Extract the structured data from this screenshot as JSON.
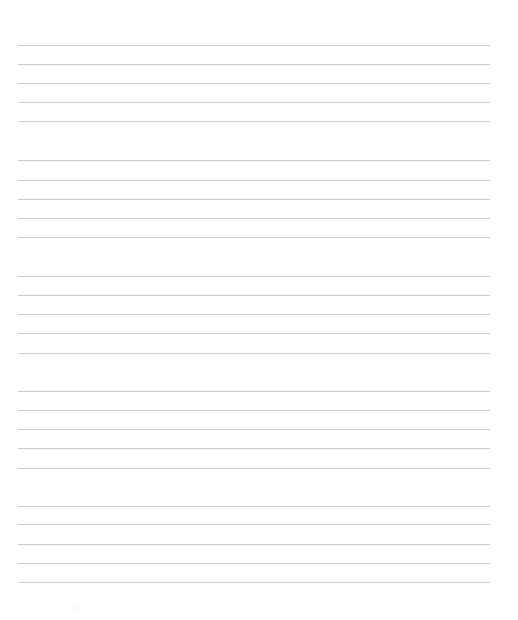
{
  "page": {
    "type": "lined-paper",
    "background_color": "#ffffff",
    "rule_color": "#cbcbcb",
    "rule_left": 18,
    "rule_width": 472,
    "groups": [
      {
        "rules_y": [
          45,
          64,
          83,
          102,
          121
        ]
      },
      {
        "rules_y": [
          160,
          180,
          199,
          218,
          237
        ]
      },
      {
        "rules_y": [
          276,
          295,
          314,
          333,
          353
        ]
      },
      {
        "rules_y": [
          391,
          410,
          429,
          448,
          468
        ]
      },
      {
        "rules_y": [
          506,
          524,
          544,
          563,
          582
        ]
      }
    ]
  }
}
